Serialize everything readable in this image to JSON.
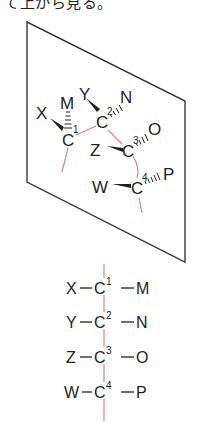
{
  "caption": "て上から見る。",
  "colors": {
    "ink": "#231f20",
    "plane": "#3a3a3a",
    "backbone": "#e0837a"
  },
  "perspective": {
    "carbons": [
      {
        "label": "C",
        "num": "1"
      },
      {
        "label": "C",
        "num": "2"
      },
      {
        "label": "C",
        "num": "3"
      },
      {
        "label": "C",
        "num": "4"
      }
    ],
    "substituents": {
      "x": "X",
      "m": "M",
      "y": "Y",
      "n": "N",
      "z": "Z",
      "o": "O",
      "w": "W",
      "p": "P"
    }
  },
  "fischer": {
    "rows": [
      {
        "left": "X",
        "carbon": "C",
        "num": "1",
        "right": "M"
      },
      {
        "left": "Y",
        "carbon": "C",
        "num": "2",
        "right": "N"
      },
      {
        "left": "Z",
        "carbon": "C",
        "num": "3",
        "right": "O"
      },
      {
        "left": "W",
        "carbon": "C",
        "num": "4",
        "right": "P"
      }
    ]
  }
}
